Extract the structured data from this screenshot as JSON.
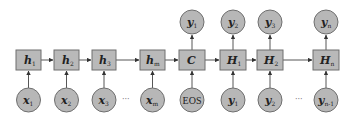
{
  "diagram": {
    "type": "seq2seq-encoder-decoder",
    "encoder": {
      "hidden_states": [
        {
          "id": "h1",
          "base": "h",
          "sub": "1"
        },
        {
          "id": "h2",
          "base": "h",
          "sub": "2"
        },
        {
          "id": "h3",
          "base": "h",
          "sub": "3"
        },
        {
          "id": "hm",
          "base": "h",
          "sub": "m"
        }
      ],
      "inputs": [
        {
          "id": "x1",
          "base": "x",
          "sub": "1"
        },
        {
          "id": "x2",
          "base": "x",
          "sub": "2"
        },
        {
          "id": "x3",
          "base": "x",
          "sub": "3"
        },
        {
          "id": "xm",
          "base": "x",
          "sub": "m"
        }
      ],
      "ellipsis": "···"
    },
    "context": {
      "id": "C",
      "label": "C",
      "input": "EOS",
      "output": {
        "base": "y",
        "sub": "1"
      }
    },
    "decoder": {
      "hidden_states": [
        {
          "id": "H1",
          "base": "H",
          "sub": "1"
        },
        {
          "id": "H2",
          "base": "H",
          "sub": "2"
        },
        {
          "id": "Hn",
          "base": "H",
          "sub": "n"
        }
      ],
      "inputs": [
        {
          "id": "y1_in",
          "base": "y",
          "sub": "1"
        },
        {
          "id": "y2_in",
          "base": "y",
          "sub": "2"
        },
        {
          "id": "yn-1_in",
          "base": "y",
          "sub": "n-1"
        }
      ],
      "outputs": [
        {
          "id": "y2_out",
          "base": "y",
          "sub": "2"
        },
        {
          "id": "y3_out",
          "base": "y",
          "sub": "3"
        },
        {
          "id": "yn_out",
          "base": "y",
          "sub": "n"
        }
      ],
      "ellipsis": "···"
    },
    "colors": {
      "node_fill": "#b8b8b8",
      "node_stroke": "#6f6f6f",
      "edge": "#444444",
      "background": "#ffffff"
    }
  }
}
